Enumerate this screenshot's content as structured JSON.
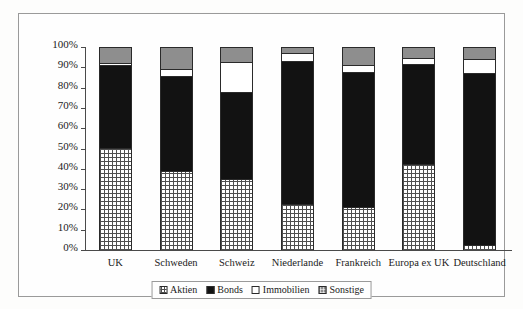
{
  "chart_data": {
    "type": "bar",
    "stacked": true,
    "normalized": true,
    "title": "",
    "xlabel": "",
    "ylabel": "",
    "ylim": [
      0,
      100
    ],
    "grid": false,
    "legend_position": "bottom",
    "categories": [
      "UK",
      "Schweden",
      "Schweiz",
      "Niederlande",
      "Frankreich",
      "Europa ex UK",
      "Deutschland"
    ],
    "ytick_labels": [
      "100%",
      "90%",
      "80%",
      "70%",
      "60%",
      "50%",
      "40%",
      "30%",
      "20%",
      "10%",
      "0%"
    ],
    "ytick_values": [
      100,
      90,
      80,
      70,
      60,
      50,
      40,
      30,
      20,
      10,
      0
    ],
    "series": [
      {
        "name": "Aktien",
        "fill": "cross-hatch",
        "color": "#4f4f4f",
        "values": [
          50.0,
          38.5,
          34.5,
          22.5,
          21.0,
          42.0,
          2.0
        ]
      },
      {
        "name": "Bonds",
        "fill": "solid",
        "color": "#121212",
        "values": [
          41.0,
          47.0,
          43.0,
          70.5,
          66.5,
          49.5,
          85.0
        ]
      },
      {
        "name": "Immobilien",
        "fill": "solid",
        "color": "#ffffff",
        "values": [
          1.0,
          3.5,
          15.0,
          4.0,
          3.5,
          3.0,
          7.0
        ]
      },
      {
        "name": "Sonstige",
        "fill": "solid",
        "color": "#8e8e8e",
        "values": [
          8.0,
          11.0,
          7.5,
          3.0,
          9.0,
          5.5,
          6.0
        ]
      }
    ]
  },
  "legend": {
    "items": [
      {
        "label": "Aktien",
        "swatch": "aktien-swatch-icon"
      },
      {
        "label": "Bonds",
        "swatch": "bonds-swatch-icon"
      },
      {
        "label": "Immobilien",
        "swatch": "immobilien-swatch-icon"
      },
      {
        "label": "Sonstige",
        "swatch": "sonstige-swatch-icon"
      }
    ]
  }
}
